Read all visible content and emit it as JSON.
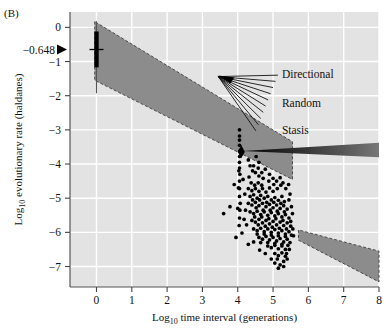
{
  "figure": {
    "panel_label": "(B)",
    "background_color": "#e3e3e3",
    "grid_color": "#ffffff",
    "band_color": "#8c8c8c",
    "marker_color": "#000000"
  },
  "chart_data": {
    "type": "scatter",
    "title": "",
    "xlabel": "Log10 time interval (generations)",
    "xlabel_prefix": "Log",
    "xlabel_sub": "10",
    "xlabel_rest": " time interval (generations)",
    "ylabel": "Log10 evolutionary rate (haldanes)",
    "ylabel_prefix": "Log",
    "ylabel_sub": "10",
    "ylabel_rest": " evolutionary rate (haldanes)",
    "xlim": [
      -0.75,
      8.0
    ],
    "ylim": [
      -7.6,
      0.45
    ],
    "xticks": [
      "0",
      "1",
      "2",
      "3",
      "4",
      "5",
      "6",
      "7",
      "8"
    ],
    "xtick_values": [
      0,
      1,
      2,
      3,
      4,
      5,
      6,
      7,
      8
    ],
    "yticks": [
      "0",
      "-1",
      "-2",
      "-3",
      "-4",
      "-5",
      "-6",
      "-7"
    ],
    "ytick_values": [
      0,
      -1,
      -2,
      -3,
      -4,
      -5,
      -6,
      -7
    ],
    "grid": true,
    "legend_position": "inside-upper-right",
    "highlight_tick": {
      "label": "-0.648",
      "value": -0.648,
      "marker": "triangle-pointer"
    },
    "boxplot": {
      "x": 0,
      "whisker_low": -1.93,
      "whisker_high": 0.18,
      "box_low": -1.17,
      "box_high": -0.12,
      "median": -0.648
    },
    "diamond_marker": {
      "x": 4.1,
      "y": -3.64
    },
    "bands": [
      {
        "name": "upper-stasis-band",
        "points": [
          [
            -0.05,
            0.17
          ],
          [
            -0.05,
            -1.55
          ],
          [
            5.55,
            -4.45
          ],
          [
            5.55,
            -3.35
          ]
        ]
      },
      {
        "name": "lower-stasis-band",
        "points": [
          [
            5.72,
            -5.93
          ],
          [
            5.72,
            -6.23
          ],
          [
            8.0,
            -7.45
          ],
          [
            8.0,
            -6.55
          ]
        ]
      }
    ],
    "fan": {
      "apex": [
        3.45,
        -1.44
      ],
      "ray_count": 10,
      "labels": [
        {
          "text": "Directional",
          "x": 5.25,
          "y": -1.37
        },
        {
          "text": "Random",
          "x": 5.25,
          "y": -2.2
        },
        {
          "text": "Stasis",
          "x": 5.25,
          "y": -3.0
        }
      ]
    },
    "wedge": {
      "name": "stasis-pointer-wedge",
      "tip": [
        4.15,
        -3.62
      ],
      "far_top": [
        8.0,
        -3.38
      ],
      "far_bottom": [
        8.0,
        -3.8
      ]
    },
    "series": [
      {
        "name": "evolutionary-rate-points",
        "marker": "filled-circle",
        "points": [
          [
            4.05,
            -3.0
          ],
          [
            4.05,
            -3.18
          ],
          [
            4.05,
            -3.3
          ],
          [
            4.05,
            -3.45
          ],
          [
            4.06,
            -3.62
          ],
          [
            4.05,
            -3.78
          ],
          [
            4.05,
            -3.95
          ],
          [
            4.05,
            -4.12
          ],
          [
            4.06,
            -4.3
          ],
          [
            4.05,
            -4.5
          ],
          [
            4.05,
            -4.72
          ],
          [
            4.05,
            -4.95
          ],
          [
            4.07,
            -5.15
          ],
          [
            4.06,
            -5.35
          ],
          [
            4.05,
            -5.58
          ],
          [
            4.04,
            -5.8
          ],
          [
            4.3,
            -3.88
          ],
          [
            4.35,
            -4.05
          ],
          [
            4.42,
            -4.2
          ],
          [
            4.32,
            -4.38
          ],
          [
            4.5,
            -4.25
          ],
          [
            4.6,
            -4.35
          ],
          [
            4.38,
            -4.55
          ],
          [
            4.48,
            -4.62
          ],
          [
            4.58,
            -4.55
          ],
          [
            4.68,
            -4.62
          ],
          [
            4.3,
            -4.72
          ],
          [
            4.4,
            -4.78
          ],
          [
            4.5,
            -4.72
          ],
          [
            4.6,
            -4.8
          ],
          [
            4.7,
            -4.72
          ],
          [
            4.8,
            -4.82
          ],
          [
            4.9,
            -4.7
          ],
          [
            5.0,
            -4.8
          ],
          [
            4.35,
            -4.95
          ],
          [
            4.45,
            -4.9
          ],
          [
            4.55,
            -5.0
          ],
          [
            4.65,
            -4.92
          ],
          [
            4.75,
            -5.0
          ],
          [
            4.85,
            -4.95
          ],
          [
            4.95,
            -5.05
          ],
          [
            5.05,
            -4.98
          ],
          [
            5.15,
            -5.06
          ],
          [
            5.25,
            -4.95
          ],
          [
            5.32,
            -5.1
          ],
          [
            4.3,
            -5.15
          ],
          [
            4.4,
            -5.2
          ],
          [
            4.5,
            -5.12
          ],
          [
            4.6,
            -5.22
          ],
          [
            4.7,
            -5.15
          ],
          [
            4.8,
            -5.25
          ],
          [
            4.9,
            -5.18
          ],
          [
            5.0,
            -5.28
          ],
          [
            5.1,
            -5.2
          ],
          [
            5.2,
            -5.3
          ],
          [
            5.3,
            -5.22
          ],
          [
            5.4,
            -5.32
          ],
          [
            4.35,
            -5.4
          ],
          [
            4.45,
            -5.45
          ],
          [
            4.55,
            -5.38
          ],
          [
            4.65,
            -5.48
          ],
          [
            4.75,
            -5.4
          ],
          [
            4.85,
            -5.5
          ],
          [
            4.95,
            -5.42
          ],
          [
            5.05,
            -5.52
          ],
          [
            5.15,
            -5.45
          ],
          [
            5.25,
            -5.55
          ],
          [
            5.35,
            -5.48
          ],
          [
            5.45,
            -5.58
          ],
          [
            4.4,
            -5.65
          ],
          [
            4.5,
            -5.7
          ],
          [
            4.6,
            -5.62
          ],
          [
            4.7,
            -5.72
          ],
          [
            4.8,
            -5.65
          ],
          [
            4.9,
            -5.75
          ],
          [
            5.0,
            -5.68
          ],
          [
            5.1,
            -5.78
          ],
          [
            5.2,
            -5.7
          ],
          [
            5.3,
            -5.8
          ],
          [
            5.4,
            -5.72
          ],
          [
            5.5,
            -5.82
          ],
          [
            4.45,
            -5.9
          ],
          [
            4.55,
            -5.95
          ],
          [
            4.65,
            -5.88
          ],
          [
            4.75,
            -5.98
          ],
          [
            4.85,
            -5.9
          ],
          [
            4.95,
            -6.0
          ],
          [
            5.05,
            -5.92
          ],
          [
            5.15,
            -6.02
          ],
          [
            5.25,
            -5.95
          ],
          [
            5.35,
            -6.05
          ],
          [
            5.45,
            -5.98
          ],
          [
            5.52,
            -6.08
          ],
          [
            4.6,
            -6.15
          ],
          [
            4.7,
            -6.2
          ],
          [
            4.8,
            -6.12
          ],
          [
            4.9,
            -6.22
          ],
          [
            5.0,
            -6.15
          ],
          [
            5.1,
            -6.25
          ],
          [
            5.2,
            -6.18
          ],
          [
            5.3,
            -6.28
          ],
          [
            5.4,
            -6.2
          ],
          [
            5.48,
            -6.3
          ],
          [
            4.85,
            -6.4
          ],
          [
            4.95,
            -6.45
          ],
          [
            5.05,
            -6.38
          ],
          [
            5.15,
            -6.48
          ],
          [
            5.25,
            -6.4
          ],
          [
            5.35,
            -6.5
          ],
          [
            5.05,
            -6.62
          ],
          [
            5.15,
            -6.68
          ],
          [
            5.25,
            -6.6
          ],
          [
            5.35,
            -6.7
          ],
          [
            5.3,
            -6.85
          ],
          [
            5.4,
            -6.78
          ],
          [
            5.2,
            -6.95
          ],
          [
            5.3,
            -7.0
          ],
          [
            3.78,
            -5.25
          ],
          [
            3.6,
            -5.45
          ],
          [
            3.9,
            -4.6
          ],
          [
            4.15,
            -4.45
          ],
          [
            4.2,
            -4.88
          ],
          [
            4.22,
            -5.35
          ],
          [
            4.18,
            -5.62
          ],
          [
            4.25,
            -5.78
          ],
          [
            4.12,
            -6.02
          ],
          [
            4.6,
            -3.95
          ],
          [
            4.45,
            -4.05
          ],
          [
            4.52,
            -3.78
          ],
          [
            5.45,
            -5.05
          ],
          [
            5.52,
            -5.25
          ],
          [
            5.55,
            -5.45
          ],
          [
            5.48,
            -4.88
          ],
          [
            4.3,
            -6.35
          ],
          [
            4.45,
            -6.28
          ],
          [
            4.62,
            -6.52
          ],
          [
            4.78,
            -6.62
          ],
          [
            4.95,
            -6.78
          ],
          [
            5.05,
            -6.9
          ],
          [
            5.15,
            -7.05
          ],
          [
            5.12,
            -6.78
          ],
          [
            4.72,
            -4.42
          ],
          [
            4.88,
            -4.5
          ],
          [
            5.02,
            -4.6
          ],
          [
            5.12,
            -4.72
          ],
          [
            5.22,
            -4.62
          ],
          [
            4.42,
            -5.05
          ],
          [
            4.52,
            -5.28
          ],
          [
            4.62,
            -5.05
          ],
          [
            4.72,
            -5.35
          ],
          [
            4.82,
            -5.12
          ],
          [
            4.92,
            -5.35
          ],
          [
            5.02,
            -5.12
          ],
          [
            5.12,
            -5.38
          ],
          [
            5.22,
            -5.15
          ],
          [
            5.32,
            -5.4
          ],
          [
            4.48,
            -5.55
          ],
          [
            4.58,
            -5.78
          ],
          [
            4.68,
            -5.55
          ],
          [
            4.78,
            -5.82
          ],
          [
            4.88,
            -5.6
          ],
          [
            4.98,
            -5.85
          ],
          [
            5.08,
            -5.6
          ],
          [
            5.18,
            -5.88
          ],
          [
            5.28,
            -5.65
          ],
          [
            5.38,
            -5.9
          ],
          [
            4.55,
            -6.05
          ],
          [
            4.65,
            -6.3
          ],
          [
            4.75,
            -6.05
          ],
          [
            4.85,
            -6.3
          ],
          [
            4.95,
            -6.08
          ],
          [
            5.05,
            -6.32
          ],
          [
            5.15,
            -6.1
          ],
          [
            5.25,
            -6.35
          ],
          [
            5.35,
            -6.12
          ],
          [
            5.42,
            -6.38
          ],
          [
            4.68,
            -4.25
          ],
          [
            4.78,
            -4.15
          ],
          [
            4.9,
            -4.3
          ],
          [
            5.0,
            -4.42
          ],
          [
            4.58,
            -4.12
          ],
          [
            5.1,
            -4.5
          ],
          [
            5.2,
            -4.4
          ],
          [
            5.28,
            -4.55
          ],
          [
            5.36,
            -4.72
          ],
          [
            5.44,
            -4.6
          ],
          [
            5.5,
            -5.68
          ],
          [
            5.56,
            -5.9
          ],
          [
            5.58,
            -6.1
          ],
          [
            5.46,
            -6.5
          ],
          [
            5.38,
            -6.62
          ],
          [
            3.95,
            -6.15
          ],
          [
            4.0,
            -5.3
          ],
          [
            4.02,
            -4.7
          ],
          [
            4.03,
            -4.2
          ]
        ]
      }
    ]
  }
}
